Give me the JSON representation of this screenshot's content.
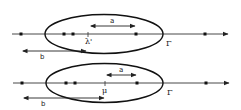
{
  "diagram": {
    "panels": [
      {
        "id": "top",
        "curve_label": "Γ",
        "point_label": "λ'",
        "interval_a_label": "a",
        "interval_b_label": "b",
        "ellipse": {
          "cx": 104,
          "cy": 34,
          "rx": 59,
          "ry": 19.5
        },
        "axis_y": 34,
        "dots_x": [
          21,
          64,
          73,
          136,
          205
        ],
        "point_x": 88
      },
      {
        "id": "bottom",
        "curve_label": "Γ",
        "point_label": "μ",
        "interval_a_label": "a",
        "interval_b_label": "b",
        "ellipse": {
          "cx": 104.5,
          "cy": 83,
          "rx": 58.5,
          "ry": 19.5
        },
        "axis_y": 83,
        "dots_x": [
          22,
          66,
          75,
          137,
          206
        ],
        "point_x": 105
      }
    ],
    "colors": {
      "stroke": "#222222",
      "background": "#ffffff"
    }
  }
}
